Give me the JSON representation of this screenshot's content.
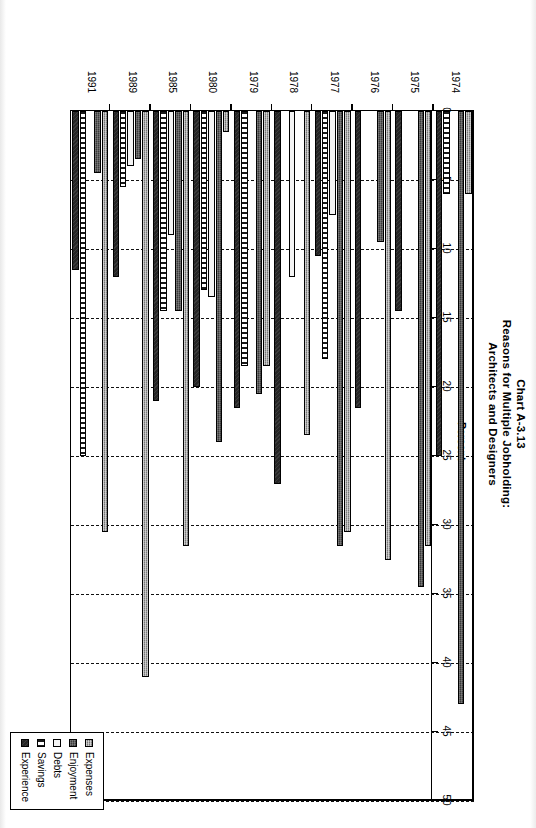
{
  "chart_data": {
    "type": "bar",
    "orientation": "horizontal",
    "title": "Chart A-3.13",
    "subtitle": "Reasons for Multiple Jobholding:",
    "subtitle2": "Architects and Designers",
    "xlabel": "Percent",
    "ylabel": "",
    "xlim": [
      0,
      50
    ],
    "xticks": [
      "0",
      "5",
      "10",
      "15",
      "20",
      "25",
      "30",
      "35",
      "40",
      "45",
      "50"
    ],
    "grid": "vertical-dashed",
    "legend_position": "bottom-right",
    "categories": [
      "1974",
      "1975",
      "1976",
      "1977",
      "1978",
      "1979",
      "1980",
      "1985",
      "1989",
      "1991"
    ],
    "series": [
      {
        "name": "Expenses",
        "values": [
          6.0,
          31.5,
          32.5,
          30.5,
          23.5,
          18.5,
          1.5,
          31.5,
          41.0,
          30.5
        ]
      },
      {
        "name": "Enjoyment",
        "values": [
          43.0,
          34.5,
          9.5,
          31.5,
          0.0,
          20.5,
          24.0,
          14.5,
          3.5,
          4.5
        ]
      },
      {
        "name": "Debts",
        "values": [
          0.0,
          0.0,
          0.0,
          7.5,
          12.0,
          0.0,
          13.5,
          9.0,
          4.0,
          0.0
        ]
      },
      {
        "name": "Savings",
        "values": [
          6.0,
          0.0,
          0.0,
          18.0,
          0.0,
          18.5,
          13.0,
          14.5,
          5.5,
          25.0
        ]
      },
      {
        "name": "Experience",
        "values": [
          25.0,
          14.5,
          21.5,
          10.5,
          27.0,
          21.5,
          20.0,
          21.0,
          12.0,
          11.5
        ]
      }
    ]
  },
  "title": {
    "line1": "Chart A-3.13",
    "line2": "Reasons for Multiple Jobholding:",
    "line3": "Architects and Designers"
  },
  "axis": {
    "label": "Percent",
    "ticks": [
      "0",
      "5",
      "10",
      "15",
      "20",
      "25",
      "30",
      "35",
      "40",
      "45",
      "50"
    ]
  },
  "years": [
    "1974",
    "1975",
    "1976",
    "1977",
    "1978",
    "1979",
    "1980",
    "1985",
    "1989",
    "1991"
  ],
  "legend": {
    "items": [
      {
        "label": "Expenses",
        "key": "expenses"
      },
      {
        "label": "Enjoyment",
        "key": "enjoyment"
      },
      {
        "label": "Debts",
        "key": "debts"
      },
      {
        "label": "Savings",
        "key": "savings"
      },
      {
        "label": "Experience",
        "key": "experience"
      }
    ]
  }
}
